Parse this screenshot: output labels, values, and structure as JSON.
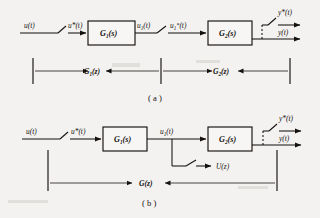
{
  "figure": {
    "background_color": "#f3f2f0",
    "ink_color": "#15110f",
    "panels": [
      {
        "id": "a",
        "caption": "( a )",
        "description": "Cascaded sampled-data system with sampler between G1(s) and G2(s)",
        "signals": {
          "input": "u(t)",
          "sampled_input": "u*(t)",
          "intermediate": "u",
          "intermediate_sub": "1",
          "intermediate_tail": "(t)",
          "intermediate_sampled": "u",
          "intermediate_sampled_sub": "1",
          "intermediate_sampled_sup": "*",
          "intermediate_sampled_tail": "(t)",
          "output_sampled": "y*(t)",
          "output": "y(t)"
        },
        "blocks": [
          {
            "name": "G",
            "sub": "1",
            "tail": "(s)"
          },
          {
            "name": "G",
            "sub": "2",
            "tail": "(s)"
          }
        ],
        "dimensions": [
          {
            "name": "G",
            "sub": "1",
            "tail": "(z)"
          },
          {
            "name": "G",
            "sub": "2",
            "tail": "(z)"
          }
        ]
      },
      {
        "id": "b",
        "caption": "( b )",
        "description": "Cascaded system with single overall transfer function G(z) and sampled branch output U(z)",
        "signals": {
          "input": "u(t)",
          "sampled_input": "u*(t)",
          "intermediate": "u",
          "intermediate_sub": "1",
          "intermediate_tail": "(t)",
          "branch_output": "U(z)",
          "output_sampled": "y*(t)",
          "output": "y(t)"
        },
        "blocks": [
          {
            "name": "G",
            "sub": "1",
            "tail": "(s)"
          },
          {
            "name": "G",
            "sub": "2",
            "tail": "(s)"
          }
        ],
        "dimensions": [
          {
            "name": "G",
            "sub": "",
            "tail": "(z)"
          }
        ]
      }
    ]
  }
}
